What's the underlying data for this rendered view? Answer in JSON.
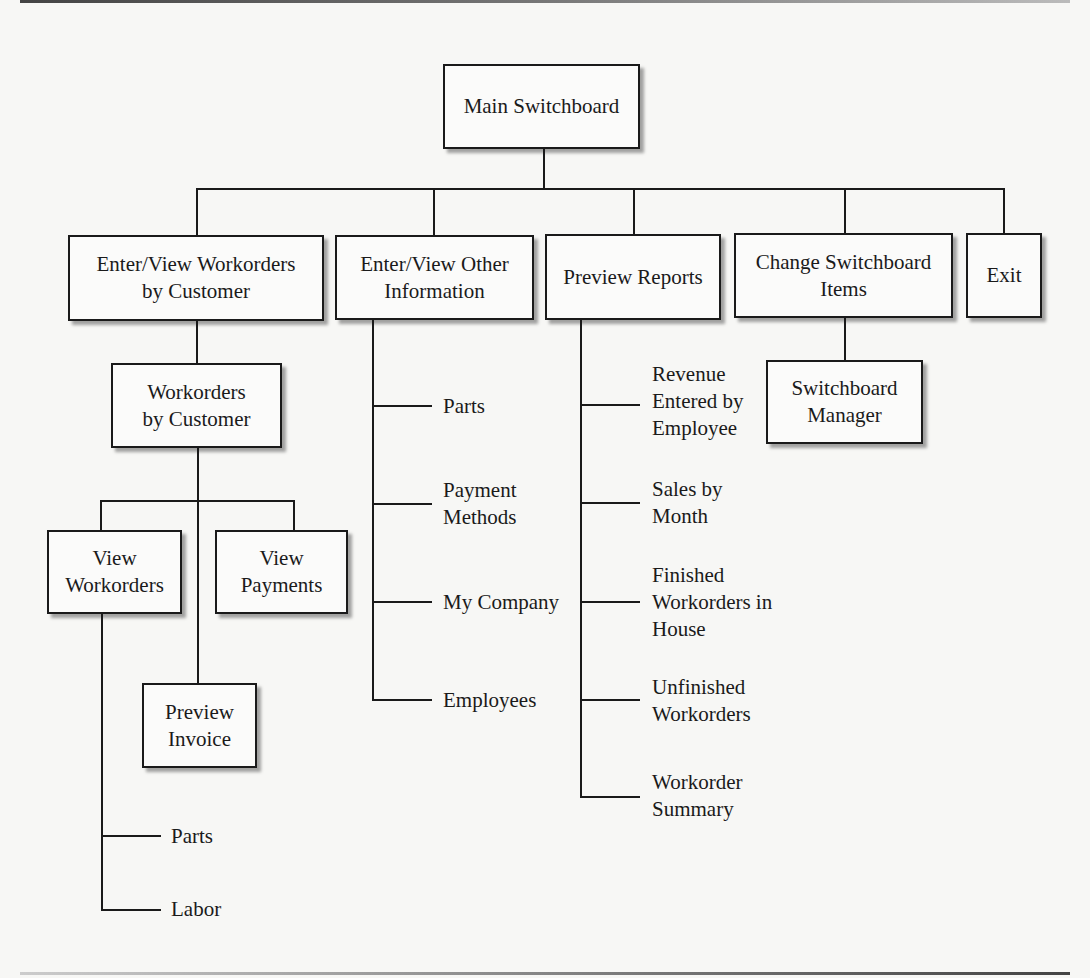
{
  "diagram": {
    "type": "switchboard-hierarchy",
    "root": {
      "label": "Main Switchboard"
    },
    "level1": [
      {
        "label": "Enter/View Workorders\nby Customer"
      },
      {
        "label": "Enter/View Other\nInformation"
      },
      {
        "label": "Preview Reports"
      },
      {
        "label": "Change Switchboard\nItems"
      },
      {
        "label": "Exit"
      }
    ],
    "workorders_branch": {
      "form": {
        "label": "Workorders\nby Customer"
      },
      "children": [
        {
          "label": "View\nWorkorders"
        },
        {
          "label": "View\nPayments"
        },
        {
          "label": "Preview\nInvoice"
        }
      ],
      "view_workorders_items": [
        {
          "label": "Parts"
        },
        {
          "label": "Labor"
        }
      ]
    },
    "other_info_items": [
      {
        "label": "Parts"
      },
      {
        "label": "Payment\nMethods"
      },
      {
        "label": "My Company"
      },
      {
        "label": "Employees"
      }
    ],
    "report_items": [
      {
        "label": "Revenue\nEntered by\nEmployee"
      },
      {
        "label": "Sales by\nMonth"
      },
      {
        "label": "Finished\nWorkorders in\nHouse"
      },
      {
        "label": "Unfinished\nWorkorders"
      },
      {
        "label": "Workorder\nSummary"
      }
    ],
    "change_items": [
      {
        "label": "Switchboard\nManager"
      }
    ]
  }
}
